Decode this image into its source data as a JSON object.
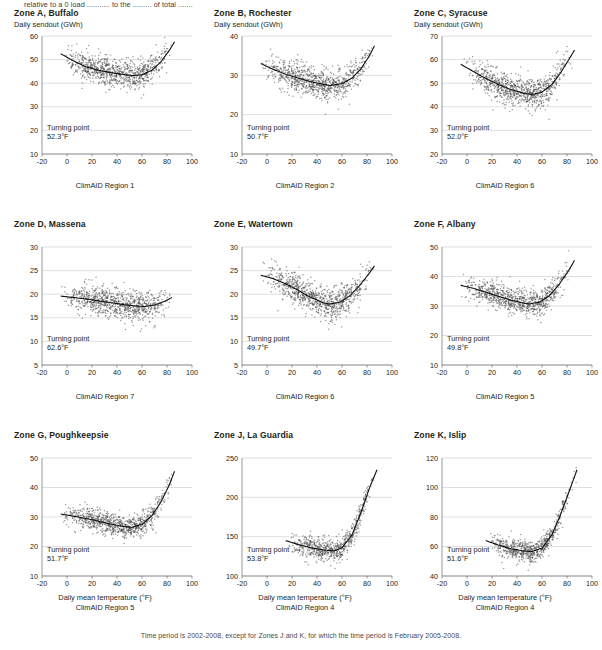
{
  "top_note": "relative to a 0 load ........... to the ......... of total .......",
  "footnote": "Time period is 2002-2008, except for Zones J and K, for which the time period is February 2005-2008.",
  "common": {
    "ylabel": "Daily sendout (GWh)",
    "xlabel": "Daily mean temperature (°F)",
    "turning_label": "Turning point"
  },
  "chart_data": [
    {
      "type": "scatter",
      "title": "Zone A, Buffalo",
      "ylabel": "Daily sendout (GWh)",
      "xlabel": "",
      "region": "ClimAID Region 1",
      "turning_point": "52.3°F",
      "turning_point_x": 52.3,
      "xlim": [
        -20,
        100
      ],
      "xticks": [
        -20,
        0,
        20,
        40,
        60,
        80,
        100
      ],
      "ylim": [
        10,
        60
      ],
      "yticks": [
        10,
        20,
        30,
        40,
        50,
        60
      ],
      "curve": [
        {
          "x": -5,
          "y": 52.5
        },
        {
          "x": 5,
          "y": 49.5
        },
        {
          "x": 15,
          "y": 47.0
        },
        {
          "x": 25,
          "y": 45.5
        },
        {
          "x": 35,
          "y": 44.5
        },
        {
          "x": 45,
          "y": 43.7
        },
        {
          "x": 52.3,
          "y": 43.2
        },
        {
          "x": 60,
          "y": 43.6
        },
        {
          "x": 68,
          "y": 45.5
        },
        {
          "x": 75,
          "y": 49.0
        },
        {
          "x": 82,
          "y": 54.0
        },
        {
          "x": 86,
          "y": 57.5
        }
      ],
      "scatter_spread": 3.0,
      "n_points": 900
    },
    {
      "type": "scatter",
      "title": "Zone B, Rochester",
      "ylabel": "Daily sendout (GWh)",
      "xlabel": "",
      "region": "ClimAID Region 2",
      "turning_point": "50.7°F",
      "turning_point_x": 50.7,
      "xlim": [
        -20,
        100
      ],
      "xticks": [
        -20,
        0,
        20,
        40,
        60,
        80,
        100
      ],
      "ylim": [
        10,
        40
      ],
      "yticks": [
        10,
        20,
        30,
        40
      ],
      "curve": [
        {
          "x": -5,
          "y": 33.0
        },
        {
          "x": 5,
          "y": 31.5
        },
        {
          "x": 15,
          "y": 30.3
        },
        {
          "x": 25,
          "y": 29.3
        },
        {
          "x": 35,
          "y": 28.4
        },
        {
          "x": 45,
          "y": 27.7
        },
        {
          "x": 50.7,
          "y": 27.4
        },
        {
          "x": 60,
          "y": 27.9
        },
        {
          "x": 68,
          "y": 29.3
        },
        {
          "x": 75,
          "y": 31.6
        },
        {
          "x": 82,
          "y": 35.0
        },
        {
          "x": 86,
          "y": 37.5
        }
      ],
      "scatter_spread": 1.9,
      "n_points": 900
    },
    {
      "type": "scatter",
      "title": "Zone C, Syracuse",
      "ylabel": "Daily sendout (GWh)",
      "xlabel": "",
      "region": "ClimAID Region 6",
      "turning_point": "52.0°F",
      "turning_point_x": 52.0,
      "xlim": [
        -20,
        100
      ],
      "xticks": [
        -20,
        0,
        20,
        40,
        60,
        80,
        100
      ],
      "ylim": [
        20,
        70
      ],
      "yticks": [
        20,
        30,
        40,
        50,
        60,
        70
      ],
      "curve": [
        {
          "x": -5,
          "y": 58.0
        },
        {
          "x": 5,
          "y": 55.0
        },
        {
          "x": 15,
          "y": 52.0
        },
        {
          "x": 25,
          "y": 49.5
        },
        {
          "x": 35,
          "y": 47.3
        },
        {
          "x": 45,
          "y": 45.8
        },
        {
          "x": 52.0,
          "y": 45.2
        },
        {
          "x": 60,
          "y": 46.2
        },
        {
          "x": 68,
          "y": 49.5
        },
        {
          "x": 75,
          "y": 54.5
        },
        {
          "x": 82,
          "y": 60.5
        },
        {
          "x": 86,
          "y": 64.0
        }
      ],
      "scatter_spread": 3.2,
      "n_points": 900
    },
    {
      "type": "scatter",
      "title": "Zone D, Massena",
      "ylabel": "",
      "xlabel": "",
      "region": "ClimAID Region 7",
      "turning_point": "62.6°F",
      "turning_point_x": 62.6,
      "xlim": [
        -20,
        100
      ],
      "xticks": [
        -20,
        0,
        20,
        40,
        60,
        80,
        100
      ],
      "ylim": [
        5,
        30
      ],
      "yticks": [
        5,
        10,
        15,
        20,
        25,
        30
      ],
      "curve": [
        {
          "x": -5,
          "y": 19.6
        },
        {
          "x": 5,
          "y": 19.3
        },
        {
          "x": 15,
          "y": 19.0
        },
        {
          "x": 25,
          "y": 18.6
        },
        {
          "x": 35,
          "y": 18.2
        },
        {
          "x": 45,
          "y": 17.8
        },
        {
          "x": 55,
          "y": 17.5
        },
        {
          "x": 62.6,
          "y": 17.4
        },
        {
          "x": 70,
          "y": 17.7
        },
        {
          "x": 78,
          "y": 18.5
        },
        {
          "x": 84,
          "y": 19.3
        }
      ],
      "scatter_spread": 1.5,
      "n_points": 900
    },
    {
      "type": "scatter",
      "title": "Zone E, Watertown",
      "ylabel": "",
      "xlabel": "",
      "region": "ClimAID Region 6",
      "turning_point": "49.7°F",
      "turning_point_x": 49.7,
      "xlim": [
        -20,
        100
      ],
      "xticks": [
        -20,
        0,
        20,
        40,
        60,
        80,
        100
      ],
      "ylim": [
        5,
        30
      ],
      "yticks": [
        5,
        10,
        15,
        20,
        25,
        30
      ],
      "curve": [
        {
          "x": -5,
          "y": 24.0
        },
        {
          "x": 5,
          "y": 23.3
        },
        {
          "x": 15,
          "y": 22.2
        },
        {
          "x": 25,
          "y": 20.8
        },
        {
          "x": 35,
          "y": 19.3
        },
        {
          "x": 45,
          "y": 18.2
        },
        {
          "x": 49.7,
          "y": 17.9
        },
        {
          "x": 58,
          "y": 18.3
        },
        {
          "x": 66,
          "y": 19.6
        },
        {
          "x": 74,
          "y": 21.8
        },
        {
          "x": 82,
          "y": 24.5
        },
        {
          "x": 86,
          "y": 26.0
        }
      ],
      "scatter_spread": 1.6,
      "n_points": 900
    },
    {
      "type": "scatter",
      "title": "Zone F, Albany",
      "ylabel": "",
      "xlabel": "",
      "region": "ClimAID Region 5",
      "turning_point": "49.8°F",
      "turning_point_x": 49.8,
      "xlim": [
        -20,
        100
      ],
      "xticks": [
        -20,
        0,
        20,
        40,
        60,
        80,
        100
      ],
      "ylim": [
        10,
        50
      ],
      "yticks": [
        10,
        20,
        30,
        40,
        50
      ],
      "curve": [
        {
          "x": -5,
          "y": 37.0
        },
        {
          "x": 5,
          "y": 36.0
        },
        {
          "x": 15,
          "y": 34.7
        },
        {
          "x": 25,
          "y": 33.3
        },
        {
          "x": 35,
          "y": 32.0
        },
        {
          "x": 45,
          "y": 31.0
        },
        {
          "x": 49.8,
          "y": 30.7
        },
        {
          "x": 58,
          "y": 31.3
        },
        {
          "x": 66,
          "y": 33.5
        },
        {
          "x": 74,
          "y": 37.5
        },
        {
          "x": 82,
          "y": 42.5
        },
        {
          "x": 86,
          "y": 45.5
        }
      ],
      "scatter_spread": 2.2,
      "n_points": 900
    },
    {
      "type": "scatter",
      "title": "Zone G, Poughkeepsie",
      "ylabel": "",
      "xlabel": "Daily mean temperature (°F)",
      "region": "ClimAID Region 5",
      "turning_point": "51.7°F",
      "turning_point_x": 51.7,
      "xlim": [
        -20,
        100
      ],
      "xticks": [
        -20,
        0,
        20,
        40,
        60,
        80,
        100
      ],
      "ylim": [
        10,
        50
      ],
      "yticks": [
        10,
        20,
        30,
        40,
        50
      ],
      "curve": [
        {
          "x": -5,
          "y": 31.0
        },
        {
          "x": 5,
          "y": 30.3
        },
        {
          "x": 15,
          "y": 29.5
        },
        {
          "x": 25,
          "y": 28.6
        },
        {
          "x": 35,
          "y": 27.6
        },
        {
          "x": 45,
          "y": 26.8
        },
        {
          "x": 51.7,
          "y": 26.5
        },
        {
          "x": 60,
          "y": 27.5
        },
        {
          "x": 68,
          "y": 30.5
        },
        {
          "x": 75,
          "y": 35.0
        },
        {
          "x": 82,
          "y": 41.0
        },
        {
          "x": 86,
          "y": 45.5
        }
      ],
      "scatter_spread": 1.8,
      "n_points": 900
    },
    {
      "type": "scatter",
      "title": "Zone J, La Guardia",
      "ylabel": "",
      "xlabel": "Daily mean temperature (°F)",
      "region": "ClimAID Region 4",
      "turning_point": "53.8°F",
      "turning_point_x": 53.8,
      "xlim": [
        -20,
        100
      ],
      "xticks": [
        -20,
        0,
        20,
        40,
        60,
        80,
        100
      ],
      "ylim": [
        100,
        250
      ],
      "yticks": [
        100,
        150,
        200,
        250
      ],
      "curve": [
        {
          "x": 15,
          "y": 145
        },
        {
          "x": 25,
          "y": 140
        },
        {
          "x": 35,
          "y": 136
        },
        {
          "x": 45,
          "y": 133
        },
        {
          "x": 53.8,
          "y": 132
        },
        {
          "x": 60,
          "y": 136
        },
        {
          "x": 68,
          "y": 152
        },
        {
          "x": 75,
          "y": 180
        },
        {
          "x": 82,
          "y": 212
        },
        {
          "x": 88,
          "y": 235
        }
      ],
      "scatter_spread": 7.0,
      "n_points": 700
    },
    {
      "type": "scatter",
      "title": "Zone K, Islip",
      "ylabel": "",
      "xlabel": "Daily mean temperature (°F)",
      "region": "ClimAID Region 4",
      "turning_point": "51.6°F",
      "turning_point_x": 51.6,
      "xlim": [
        -20,
        100
      ],
      "xticks": [
        -20,
        0,
        20,
        40,
        60,
        80,
        100
      ],
      "ylim": [
        40,
        120
      ],
      "yticks": [
        40,
        60,
        80,
        100,
        120
      ],
      "curve": [
        {
          "x": 15,
          "y": 64
        },
        {
          "x": 25,
          "y": 61
        },
        {
          "x": 35,
          "y": 58.5
        },
        {
          "x": 45,
          "y": 57
        },
        {
          "x": 51.6,
          "y": 56.5
        },
        {
          "x": 60,
          "y": 59
        },
        {
          "x": 68,
          "y": 68
        },
        {
          "x": 75,
          "y": 82
        },
        {
          "x": 82,
          "y": 98
        },
        {
          "x": 88,
          "y": 112
        }
      ],
      "scatter_spread": 3.6,
      "n_points": 700
    }
  ]
}
